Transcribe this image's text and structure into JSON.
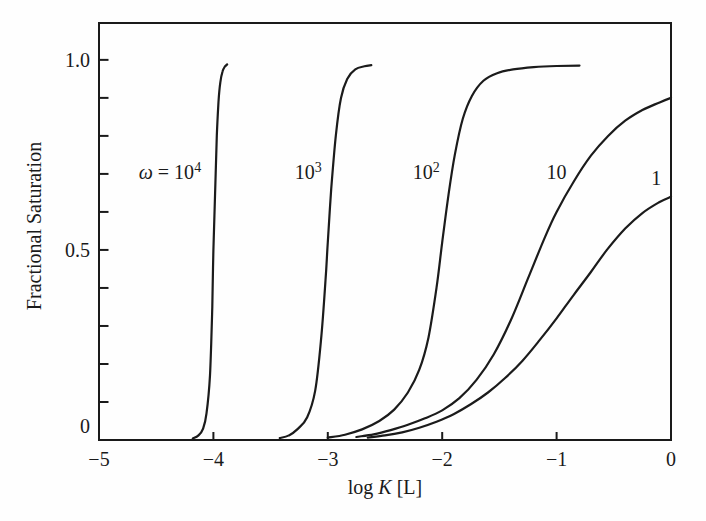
{
  "figure": {
    "background": "#fefefe",
    "ink": "#1a1a1a",
    "curve_color": "#1b1b1b",
    "frame_color": "#1a1a1a"
  },
  "chart_data": {
    "type": "line",
    "title": "",
    "xlabel_parts": [
      {
        "t": "log "
      },
      {
        "t": "K",
        "i": true
      },
      {
        "t": " [L]"
      }
    ],
    "ylabel": "Fractional Saturation",
    "xlim": [
      -5,
      0
    ],
    "ylim": [
      0,
      1.097
    ],
    "grid": false,
    "legend_position": "inline-curve-labels",
    "x_ticks": [
      {
        "value": -5,
        "label": "−5"
      },
      {
        "value": -4,
        "label": "−4"
      },
      {
        "value": -3,
        "label": "−3"
      },
      {
        "value": -2,
        "label": "−2"
      },
      {
        "value": -1,
        "label": "−1"
      },
      {
        "value": 0,
        "label": "0"
      }
    ],
    "y_ticks": {
      "minor_values": [
        0.1,
        0.2,
        0.3,
        0.4,
        0.5,
        0.6,
        0.7,
        0.8,
        0.9,
        1.0
      ],
      "labeled": [
        {
          "value": 0,
          "label": "0",
          "dy": -14
        },
        {
          "value": 0.5,
          "label": "0.5"
        },
        {
          "value": 1.0,
          "label": "1.0"
        }
      ]
    },
    "series": [
      {
        "name": "omega-1e4",
        "omega": 10000,
        "label_parts": [
          {
            "t": "ω",
            "i": true
          },
          {
            "t": " = 10"
          },
          {
            "t": "4",
            "sup": true
          }
        ],
        "label_at": [
          -4.38,
          0.705
        ],
        "points": [
          [
            -4.18,
            0.004
          ],
          [
            -4.13,
            0.012
          ],
          [
            -4.09,
            0.03
          ],
          [
            -4.06,
            0.07
          ],
          [
            -4.03,
            0.17
          ],
          [
            -4.01,
            0.35
          ],
          [
            -4.0,
            0.5
          ],
          [
            -3.985,
            0.65
          ],
          [
            -3.97,
            0.8
          ],
          [
            -3.955,
            0.89
          ],
          [
            -3.94,
            0.94
          ],
          [
            -3.92,
            0.97
          ],
          [
            -3.9,
            0.982
          ],
          [
            -3.88,
            0.988
          ]
        ]
      },
      {
        "name": "omega-1e3",
        "omega": 1000,
        "label_parts": [
          {
            "t": "10"
          },
          {
            "t": "3",
            "sup": true
          }
        ],
        "label_at": [
          -3.17,
          0.705
        ],
        "points": [
          [
            -3.42,
            0.005
          ],
          [
            -3.34,
            0.012
          ],
          [
            -3.26,
            0.03
          ],
          [
            -3.18,
            0.06
          ],
          [
            -3.11,
            0.13
          ],
          [
            -3.06,
            0.26
          ],
          [
            -3.02,
            0.42
          ],
          [
            -3.0,
            0.52
          ],
          [
            -2.97,
            0.66
          ],
          [
            -2.93,
            0.8
          ],
          [
            -2.885,
            0.9
          ],
          [
            -2.83,
            0.95
          ],
          [
            -2.76,
            0.975
          ],
          [
            -2.68,
            0.983
          ],
          [
            -2.62,
            0.986
          ]
        ]
      },
      {
        "name": "omega-1e2",
        "omega": 100,
        "label_parts": [
          {
            "t": "10"
          },
          {
            "t": "2",
            "sup": true
          }
        ],
        "label_at": [
          -2.14,
          0.705
        ],
        "points": [
          [
            -3.0,
            0.006
          ],
          [
            -2.85,
            0.014
          ],
          [
            -2.7,
            0.028
          ],
          [
            -2.55,
            0.05
          ],
          [
            -2.42,
            0.08
          ],
          [
            -2.3,
            0.125
          ],
          [
            -2.2,
            0.185
          ],
          [
            -2.12,
            0.27
          ],
          [
            -2.05,
            0.4
          ],
          [
            -2.0,
            0.52
          ],
          [
            -1.945,
            0.645
          ],
          [
            -1.89,
            0.75
          ],
          [
            -1.82,
            0.845
          ],
          [
            -1.74,
            0.905
          ],
          [
            -1.64,
            0.945
          ],
          [
            -1.52,
            0.965
          ],
          [
            -1.38,
            0.975
          ],
          [
            -1.2,
            0.981
          ],
          [
            -1.0,
            0.984
          ],
          [
            -0.8,
            0.985
          ]
        ]
      },
      {
        "name": "omega-10",
        "omega": 10,
        "label_parts": [
          {
            "t": "10"
          }
        ],
        "label_at": [
          -1.0,
          0.705
        ],
        "points": [
          [
            -2.75,
            0.008
          ],
          [
            -2.6,
            0.015
          ],
          [
            -2.45,
            0.026
          ],
          [
            -2.3,
            0.04
          ],
          [
            -2.15,
            0.057
          ],
          [
            -2.0,
            0.078
          ],
          [
            -1.85,
            0.11
          ],
          [
            -1.7,
            0.158
          ],
          [
            -1.55,
            0.225
          ],
          [
            -1.4,
            0.315
          ],
          [
            -1.25,
            0.425
          ],
          [
            -1.1,
            0.535
          ],
          [
            -1.0,
            0.6
          ],
          [
            -0.85,
            0.68
          ],
          [
            -0.7,
            0.748
          ],
          [
            -0.55,
            0.8
          ],
          [
            -0.4,
            0.84
          ],
          [
            -0.25,
            0.868
          ],
          [
            -0.1,
            0.888
          ],
          [
            0.0,
            0.9
          ]
        ]
      },
      {
        "name": "omega-1",
        "omega": 1,
        "label_parts": [
          {
            "t": "1"
          }
        ],
        "label_at": [
          -0.13,
          0.69
        ],
        "points": [
          [
            -2.65,
            0.006
          ],
          [
            -2.5,
            0.012
          ],
          [
            -2.35,
            0.02
          ],
          [
            -2.2,
            0.032
          ],
          [
            -2.05,
            0.048
          ],
          [
            -1.9,
            0.068
          ],
          [
            -1.75,
            0.094
          ],
          [
            -1.6,
            0.125
          ],
          [
            -1.45,
            0.163
          ],
          [
            -1.3,
            0.208
          ],
          [
            -1.15,
            0.262
          ],
          [
            -1.0,
            0.32
          ],
          [
            -0.85,
            0.382
          ],
          [
            -0.7,
            0.442
          ],
          [
            -0.56,
            0.5
          ],
          [
            -0.4,
            0.556
          ],
          [
            -0.25,
            0.597
          ],
          [
            -0.1,
            0.626
          ],
          [
            0.0,
            0.64
          ]
        ]
      }
    ]
  }
}
